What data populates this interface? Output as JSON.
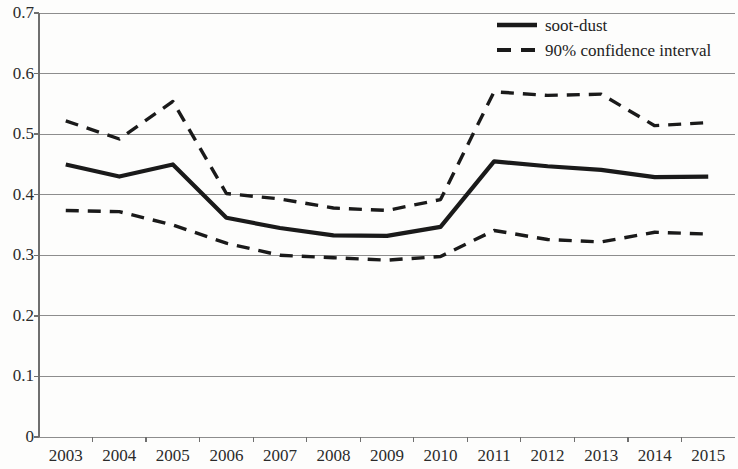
{
  "chart_data": {
    "type": "line",
    "title": "",
    "xlabel": "",
    "ylabel": "",
    "categories": [
      "2003",
      "2004",
      "2005",
      "2006",
      "2007",
      "2008",
      "2009",
      "2010",
      "2011",
      "2012",
      "2013",
      "2014",
      "2015"
    ],
    "ylim": [
      0,
      0.7
    ],
    "xlim_note": "categorical years 2003-2015",
    "ytick_labels": [
      "0",
      "0.1",
      "0.2",
      "0.3",
      "0.4",
      "0.5",
      "0.6",
      "0.7"
    ],
    "ytick_values": [
      0,
      0.1,
      0.2,
      0.3,
      0.4,
      0.5,
      0.6,
      0.7
    ],
    "grid": true,
    "grid_axis": "y",
    "legend_position": "top-right",
    "series": [
      {
        "name": "soot-dust",
        "style": "solid",
        "color": "#1a1a1a",
        "values": [
          0.45,
          0.43,
          0.45,
          0.362,
          0.345,
          0.333,
          0.332,
          0.347,
          0.455,
          0.447,
          0.441,
          0.429,
          0.43
        ]
      },
      {
        "name": "90% confidence interval upper",
        "style": "dashed",
        "color": "#1a1a1a",
        "values": [
          0.522,
          0.492,
          0.554,
          0.402,
          0.393,
          0.378,
          0.374,
          0.392,
          0.57,
          0.564,
          0.566,
          0.514,
          0.519
        ]
      },
      {
        "name": "90% confidence interval lower",
        "style": "dashed",
        "color": "#1a1a1a",
        "values": [
          0.374,
          0.372,
          0.35,
          0.32,
          0.3,
          0.296,
          0.292,
          0.298,
          0.341,
          0.326,
          0.322,
          0.338,
          0.335
        ]
      }
    ]
  },
  "legend": {
    "items": [
      {
        "label": "soot-dust",
        "style": "solid"
      },
      {
        "label": "90% confidence interval",
        "style": "dashed"
      }
    ]
  },
  "axis": {
    "y_labels": [
      "0.7",
      "0.6",
      "0.5",
      "0.4",
      "0.3",
      "0.2",
      "0.1",
      "0"
    ],
    "x_labels": [
      "2003",
      "2004",
      "2005",
      "2006",
      "2007",
      "2008",
      "2009",
      "2010",
      "2011",
      "2012",
      "2013",
      "2014",
      "2015"
    ]
  },
  "colors": {
    "line": "#1a1a1a",
    "grid": "#8d8d8d",
    "axis": "#6f6f6f",
    "text": "#2b2b2b",
    "background": "#fdfdfc"
  }
}
